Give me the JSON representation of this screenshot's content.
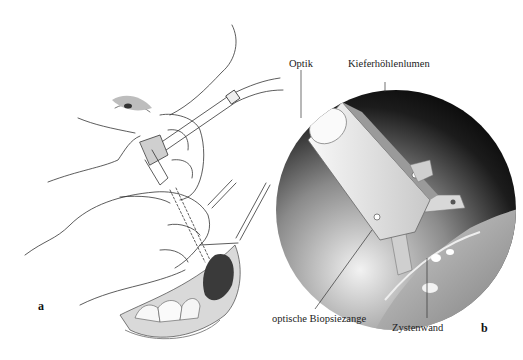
{
  "figure": {
    "panel_a": {
      "letter": "a",
      "description": "Surgeon's hands inserting endoscope and biopsy forceps through the oral vestibule into the maxillary sinus"
    },
    "panel_b": {
      "letter": "b",
      "description": "Endoscopic circular view inside the maxillary sinus",
      "labels": {
        "optik": "Optik",
        "lumen": "Kieferhöhlenlumen",
        "forceps": "optische Biopsiezange",
        "cyst_wall": "Zystenwand"
      }
    }
  }
}
